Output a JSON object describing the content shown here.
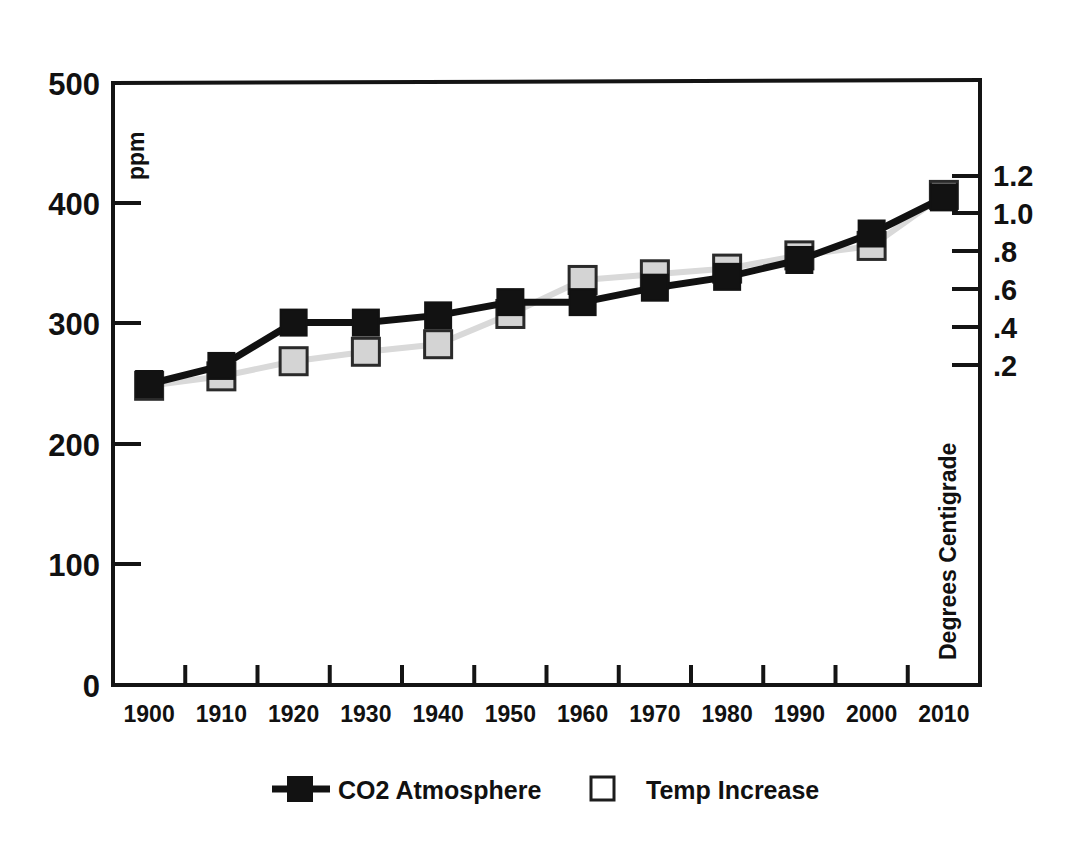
{
  "chart_data": {
    "type": "line",
    "title": "",
    "xlabel": "",
    "ylabel": "ppm",
    "y2label": "Degrees Centigrade",
    "categories": [
      "1900",
      "1910",
      "1920",
      "1930",
      "1940",
      "1950",
      "1960",
      "1970",
      "1980",
      "1990",
      "2000",
      "2010"
    ],
    "ylim": [
      0,
      500
    ],
    "yticks": [
      "0",
      "100",
      "200",
      "300",
      "400",
      "500"
    ],
    "y2lim": [
      0,
      1.32
    ],
    "y2ticks": [
      ".2",
      ".4",
      ".6",
      ".8",
      "1.0",
      "1.2"
    ],
    "y2tick_values": [
      0.2,
      0.4,
      0.6,
      0.8,
      1.0,
      1.2
    ],
    "grid": false,
    "legend_position": "bottom",
    "series": [
      {
        "name": "CO2 Atmosphere",
        "axis": "left",
        "unit": "ppm",
        "marker": "filled-square",
        "color": "#121212",
        "line_color": "#111111",
        "values": [
          250,
          265,
          301,
          301,
          307,
          318,
          318,
          330,
          339,
          353,
          375,
          405
        ]
      },
      {
        "name": "Temp Increase",
        "axis": "right",
        "unit": "Degrees Centigrade",
        "marker": "open-square",
        "color": "#d4d4d4",
        "line_color": "#d9d9d9",
        "values": [
          0.09,
          0.14,
          0.22,
          0.27,
          0.31,
          0.47,
          0.65,
          0.68,
          0.71,
          0.78,
          0.83,
          1.1
        ]
      }
    ]
  },
  "axes": {
    "left": {
      "title": "ppm",
      "ticks": [
        "500",
        "400",
        "300",
        "200",
        "100",
        "0"
      ]
    },
    "right": {
      "title": "Degrees Centigrade",
      "ticks": [
        "1.2",
        "1.0",
        ".8",
        ".6",
        ".4",
        ".2"
      ]
    },
    "bottom": {
      "ticks": [
        "1900",
        "1910",
        "1920",
        "1930",
        "1940",
        "1950",
        "1960",
        "1970",
        "1980",
        "1990",
        "2000",
        "2010"
      ]
    }
  },
  "legend": {
    "items": [
      {
        "label": "CO2 Atmosphere",
        "marker": "filled-square-with-line",
        "color": "#121212"
      },
      {
        "label": "Temp Increase",
        "marker": "open-square",
        "color": "#ffffff"
      }
    ]
  },
  "colors": {
    "background": "#ffffff",
    "axis": "#141414",
    "co2": "#121212",
    "temp_fill": "#d4d4d4",
    "temp_line": "#d9d9d9"
  }
}
